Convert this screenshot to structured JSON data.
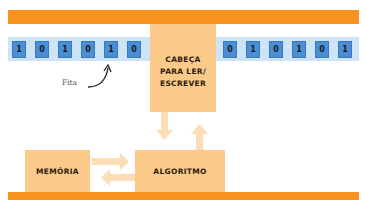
{
  "diagram": {
    "tape_left_cells": [
      "1",
      "0",
      "1",
      "0",
      "1",
      "0"
    ],
    "tape_right_cells": [
      "0",
      "1",
      "0",
      "1",
      "0",
      "1"
    ],
    "tape_label": "Fita",
    "head_label": "CABEÇA\nPARA LER/\nESCREVER",
    "memory_label": "MEMÓRIA",
    "algorithm_label": "ALGORITMO",
    "colors": {
      "bar": "#F7931E",
      "box": "#FBC98A",
      "arrow": "#FCDDB5",
      "cell": "#4A8FD6",
      "tape_strip": "#CDE3F7"
    }
  }
}
